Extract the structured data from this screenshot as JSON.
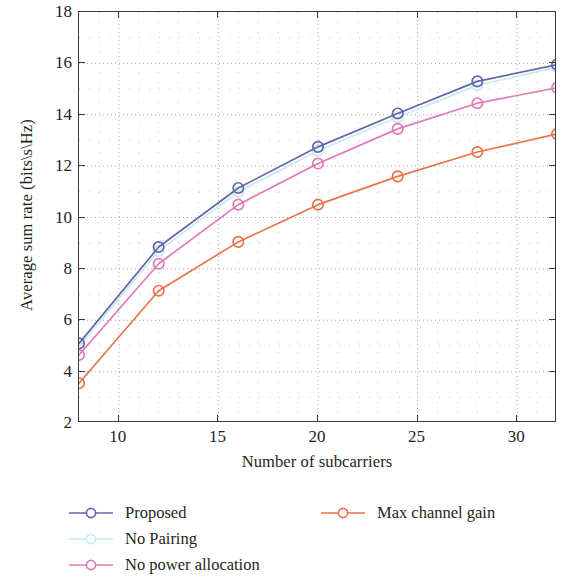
{
  "chart_data": {
    "type": "line",
    "title": "",
    "xlabel": "Number of subcarriers",
    "ylabel": "Average sum rate (bits\\s\\Hz)",
    "x": [
      8,
      12,
      16,
      20,
      24,
      28,
      32
    ],
    "xlim": [
      8,
      32
    ],
    "ylim": [
      2,
      18
    ],
    "xticks": [
      10,
      15,
      20,
      25,
      30
    ],
    "yticks": [
      2,
      4,
      6,
      8,
      10,
      12,
      14,
      16,
      18
    ],
    "xtick_labels": [
      "10",
      "15",
      "20",
      "25",
      "30"
    ],
    "ytick_labels": [
      "2",
      "4",
      "6",
      "8",
      "10",
      "12",
      "14",
      "16",
      "18"
    ],
    "grid": "dotted",
    "grid_color": "#9a9a9a",
    "legend_position": "below-plot",
    "marker": "open-circle",
    "series": [
      {
        "name": "Proposed",
        "color": "#6366a8",
        "values": [
          5.1,
          8.85,
          11.15,
          12.75,
          14.05,
          15.3,
          15.95
        ]
      },
      {
        "name": "No Pairing",
        "color": "#c9eaf0",
        "values": [
          4.98,
          8.7,
          11.0,
          12.6,
          13.9,
          15.15,
          15.85
        ]
      },
      {
        "name": "No power allocation",
        "color": "#e27ab8",
        "values": [
          4.65,
          8.2,
          10.5,
          12.1,
          13.45,
          14.45,
          15.05
        ]
      },
      {
        "name": "Max channel gain",
        "color": "#e8754a",
        "values": [
          3.55,
          7.15,
          9.05,
          10.5,
          11.6,
          12.55,
          13.25
        ]
      }
    ]
  },
  "legend": {
    "entries": [
      {
        "label": "Proposed",
        "color": "#6366a8",
        "column": 0,
        "row": 0
      },
      {
        "label": "No Pairing",
        "color": "#c9eaf0",
        "column": 0,
        "row": 1
      },
      {
        "label": "No power allocation",
        "color": "#e27ab8",
        "column": 0,
        "row": 2
      },
      {
        "label": "Max channel gain",
        "color": "#e8754a",
        "column": 1,
        "row": 0
      }
    ]
  },
  "axis_frame_color": "#3b3b3b"
}
